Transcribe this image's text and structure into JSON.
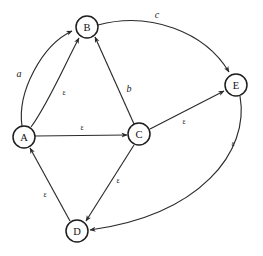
{
  "diagram": {
    "type": "directed-graph",
    "canvas": {
      "width": 263,
      "height": 256
    },
    "colors": {
      "background": "#ffffff",
      "stroke": "#2b2b2b",
      "node_stroke": "#1e1e1e",
      "node_fill": "#ffffff",
      "text": "#111111"
    },
    "nodes": [
      {
        "id": "A",
        "label": "A",
        "x": 24,
        "y": 137,
        "r": 11
      },
      {
        "id": "B",
        "label": "B",
        "x": 87,
        "y": 27,
        "r": 11
      },
      {
        "id": "C",
        "label": "C",
        "x": 139,
        "y": 134,
        "r": 11
      },
      {
        "id": "D",
        "label": "D",
        "x": 77,
        "y": 231,
        "r": 11
      },
      {
        "id": "E",
        "label": "E",
        "x": 236,
        "y": 85,
        "r": 11
      }
    ],
    "edges": [
      {
        "id": "e-ab-a",
        "from": "A",
        "to": "B",
        "label": "a",
        "label_kind": "sym",
        "label_x": 19,
        "label_y": 73,
        "curve": "arc-left"
      },
      {
        "id": "e-ab-eps",
        "from": "A",
        "to": "B",
        "label": "ε",
        "label_kind": "eps",
        "label_x": 64,
        "label_y": 92,
        "curve": "straight"
      },
      {
        "id": "e-ac-eps",
        "from": "A",
        "to": "C",
        "label": "ε",
        "label_kind": "eps",
        "label_x": 82,
        "label_y": 127,
        "curve": "straight"
      },
      {
        "id": "e-cb-b",
        "from": "C",
        "to": "B",
        "label": "b",
        "label_kind": "sym",
        "label_x": 129,
        "label_y": 88,
        "curve": "straight"
      },
      {
        "id": "e-be-c",
        "from": "B",
        "to": "E",
        "label": "c",
        "label_kind": "sym",
        "label_x": 157,
        "label_y": 14,
        "curve": "arc-up"
      },
      {
        "id": "e-ce-eps",
        "from": "C",
        "to": "E",
        "label": "ε",
        "label_kind": "eps",
        "label_x": 184,
        "label_y": 121,
        "curve": "straight"
      },
      {
        "id": "e-ed-eps",
        "from": "E",
        "to": "D",
        "label": "ε",
        "label_kind": "eps",
        "label_x": 233,
        "label_y": 143,
        "curve": "arc-right"
      },
      {
        "id": "e-cd-eps",
        "from": "C",
        "to": "D",
        "label": "ε",
        "label_kind": "eps",
        "label_x": 118,
        "label_y": 180,
        "curve": "straight"
      },
      {
        "id": "e-da-eps",
        "from": "D",
        "to": "A",
        "label": "ε",
        "label_kind": "eps",
        "label_x": 45,
        "label_y": 194,
        "curve": "straight"
      }
    ]
  }
}
